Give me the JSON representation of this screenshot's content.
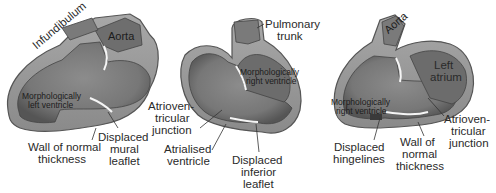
{
  "colors": {
    "wall": "#9a9a9a",
    "wall_edge": "#5a5a5a",
    "cavity": "#7d7d7d",
    "cavity_dark": "#5e5e5e",
    "valve": "#f2f2f2",
    "text": "#2a2a2a",
    "background": "#ffffff"
  },
  "figures": [
    {
      "id": "left",
      "labels": {
        "infundibulum": "Infundibulum",
        "aorta": "Aorta",
        "chamber": [
          "Morphologically",
          "left ventricle"
        ],
        "wall": [
          "Wall of normal",
          "thickness"
        ],
        "leaflet": [
          "Displaced",
          "mural",
          "leaflet"
        ]
      }
    },
    {
      "id": "middle",
      "labels": {
        "trunk": [
          "Pulmonary",
          "trunk"
        ],
        "chamber": [
          "Morphologically",
          "right ventricle"
        ],
        "av_junction": [
          "Atrioven-",
          "tricular",
          "junction"
        ],
        "atrialised": [
          "Atrialised",
          "ventricle"
        ],
        "leaflet": [
          "Displaced",
          "inferior",
          "leaflet"
        ]
      }
    },
    {
      "id": "right",
      "labels": {
        "aorta": "Aorta",
        "atrium": [
          "Left",
          "atrium"
        ],
        "chamber": [
          "Morphologically",
          "right ventricle"
        ],
        "hinge": [
          "Displaced",
          "hingelines"
        ],
        "wall": [
          "Wall of",
          "normal",
          "thickness"
        ],
        "av_junction": [
          "Atrioven-",
          "tricular",
          "junction"
        ]
      }
    }
  ]
}
